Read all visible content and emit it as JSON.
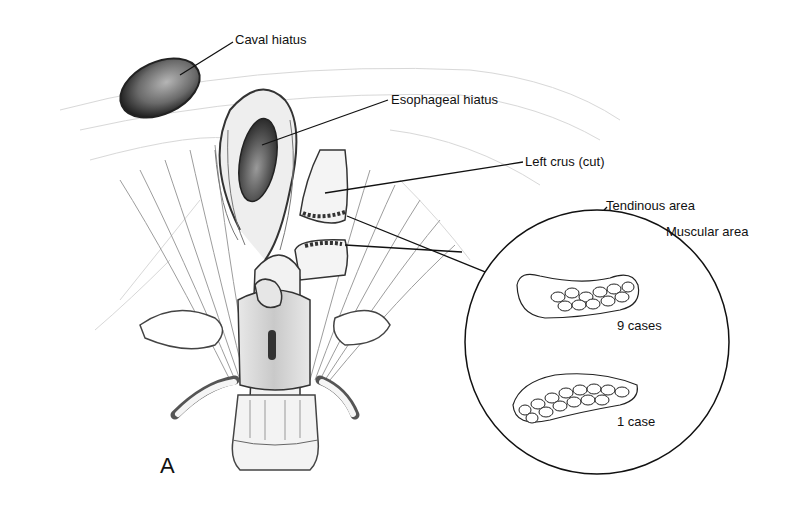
{
  "figure": {
    "panel_letter": "A",
    "labels": {
      "caval_hiatus": "Caval hiatus",
      "esophageal_hiatus": "Esophageal hiatus",
      "left_crus": "Left crus (cut)",
      "tendinous_area": "Tendinous area",
      "muscular_area": "Muscular area"
    },
    "inset": {
      "case_a": "9 cases",
      "case_b": "1 case"
    }
  }
}
